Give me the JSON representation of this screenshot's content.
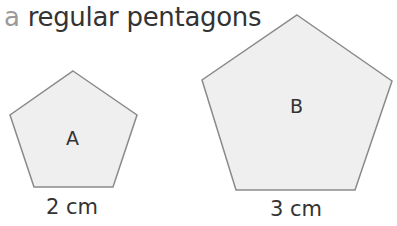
{
  "title": {
    "letter": "a",
    "text": "regular pentagons"
  },
  "shapes": [
    {
      "label": "A",
      "side": "2 cm",
      "fill": "#efefef",
      "stroke": "#8a8a8a"
    },
    {
      "label": "B",
      "side": "3 cm",
      "fill": "#efefef",
      "stroke": "#8a8a8a"
    }
  ]
}
